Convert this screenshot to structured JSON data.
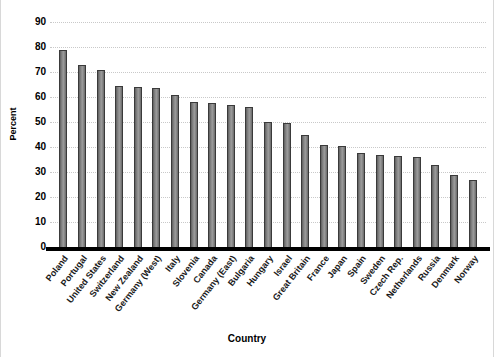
{
  "chart_data": {
    "type": "bar",
    "title": "",
    "xlabel": "Country",
    "ylabel": "Percent",
    "ylim": [
      0,
      90
    ],
    "ytick_step": 10,
    "yticks": [
      90,
      80,
      70,
      60,
      50,
      40,
      30,
      20,
      10,
      0
    ],
    "grid": true,
    "grid_style": "dotted",
    "legend": null,
    "bar_color": "#7d7d7d",
    "bar_edge_color": "#3a3a3a",
    "categories": [
      "Poland",
      "Portugal",
      "United States",
      "Switzerland",
      "New Zealand",
      "Germany (West)",
      "Italy",
      "Slovenia",
      "Canada",
      "Germany (East)",
      "Bulgaria",
      "Hungary",
      "Israel",
      "Great Britain",
      "France",
      "Japan",
      "Spain",
      "Sweden",
      "Czech Rep.",
      "Netherlands",
      "Russia",
      "Denmark",
      "Norway"
    ],
    "values": [
      79,
      73,
      71,
      64.5,
      64,
      63.5,
      61,
      58,
      57.5,
      57,
      56,
      50,
      49.5,
      45,
      41,
      40.5,
      37.5,
      37,
      36.5,
      36,
      33,
      29,
      27
    ]
  }
}
